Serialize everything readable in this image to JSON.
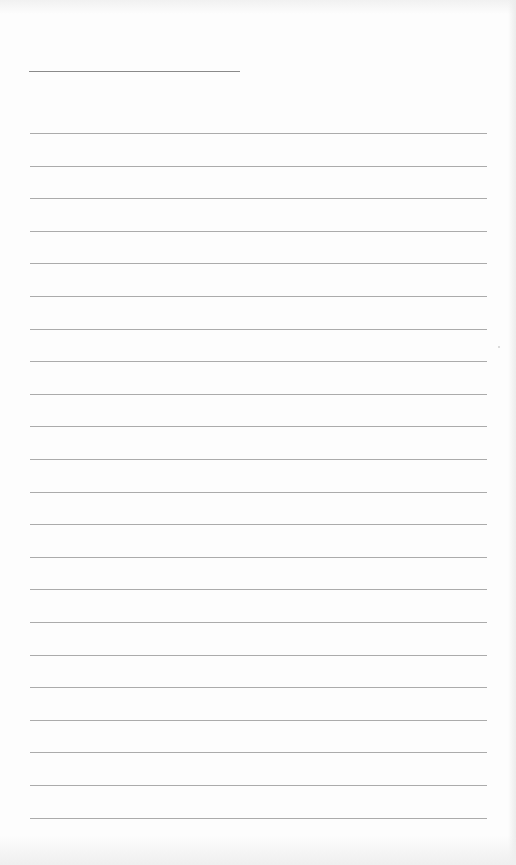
{
  "document": {
    "type": "lined-paper",
    "text": "",
    "header_line": {
      "x": 29,
      "y": 71,
      "width": 211
    },
    "ruled_lines": {
      "count": 22,
      "first_y": 133,
      "spacing": 32.6,
      "x": 30,
      "width": 457
    },
    "colors": {
      "paper": "#fdfdfd",
      "line": "#8f8f8f"
    }
  }
}
